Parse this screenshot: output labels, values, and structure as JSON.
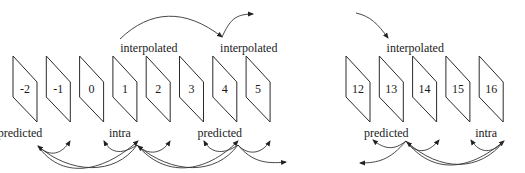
{
  "diagram": {
    "groups": [
      {
        "frames": [
          "-2",
          "-1",
          "0",
          "1",
          "2",
          "3",
          "4",
          "5"
        ],
        "top_labels": [
          {
            "text": "interpolated",
            "over_frame": "2"
          },
          {
            "text": "interpolated",
            "over_frame": "5"
          }
        ],
        "bottom_labels": [
          {
            "text": "predicted",
            "under_frame": "-2"
          },
          {
            "text": "intra",
            "under_frame": "1"
          },
          {
            "text": "predicted",
            "under_frame": "4"
          }
        ]
      },
      {
        "frames": [
          "12",
          "13",
          "14",
          "15",
          "16"
        ],
        "top_labels": [
          {
            "text": "interpolated",
            "over_frame": "14"
          }
        ],
        "bottom_labels": [
          {
            "text": "predicted",
            "under_frame": "13"
          },
          {
            "text": "intra",
            "under_frame": "16"
          }
        ]
      }
    ],
    "colors": {
      "stroke": "#2a2a2a",
      "background": "#ffffff"
    }
  }
}
